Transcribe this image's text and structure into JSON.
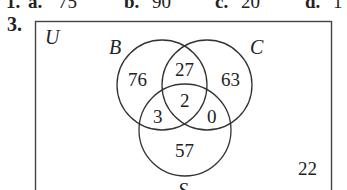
{
  "previous_answers": {
    "number": "1.",
    "items": [
      {
        "letter": "a.",
        "value": "75"
      },
      {
        "letter": "b.",
        "value": "90"
      },
      {
        "letter": "c.",
        "value": "20"
      },
      {
        "letter": "d.",
        "value": "1"
      }
    ]
  },
  "problem": {
    "number": "3.",
    "venn": {
      "universe_label": "U",
      "sets": [
        {
          "label": "B"
        },
        {
          "label": "C"
        },
        {
          "label": "S"
        }
      ],
      "regions": {
        "B_only": "76",
        "B_and_C_only": "27",
        "C_only": "63",
        "B_and_C_and_S": "2",
        "B_and_S_only": "3",
        "C_and_S_only": "0",
        "S_only": "57",
        "outside": "22"
      }
    }
  }
}
